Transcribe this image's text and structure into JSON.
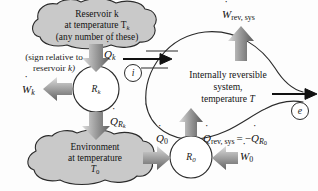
{
  "figure": {
    "type": "thermodynamics-availability-diagram"
  },
  "reservoir": {
    "line1": "Reservoir k",
    "line2_pre": "at temperature T",
    "line2_sub": "k",
    "line3": "(any number of these)",
    "fill": "#c9c9c9",
    "stroke": "#2b2b2b"
  },
  "environment": {
    "line1": "Environment",
    "line2": "at temperature",
    "line3_pre": "T",
    "line3_sub": "0",
    "fill": "#c9c9c9",
    "stroke": "#2b2b2b"
  },
  "system": {
    "line1": "Internally reversible",
    "line2": "system,",
    "line3_pre": "temperature ",
    "line3_var": "T",
    "stroke": "#2b2b2b"
  },
  "note": {
    "line1": "(sign relative to",
    "line2_pre": "reservoir ",
    "line2_var": "k)"
  },
  "cycles": {
    "Rk": {
      "base": "R",
      "sub": "k"
    },
    "R0": {
      "base": "R",
      "sub": "0"
    }
  },
  "ports": {
    "inlet": "i",
    "outlet": "e"
  },
  "labels": {
    "Qk": {
      "base": "Q",
      "sub": "k",
      "dot": true
    },
    "Wk": {
      "base": "W",
      "sub": "k",
      "dot": true
    },
    "QRk": {
      "base": "Q",
      "sub": "R",
      "sub2": "k",
      "dot": true
    },
    "Q0": {
      "base": "Q",
      "sub": "0",
      "dot": true
    },
    "W0": {
      "base": "W",
      "sub": "0",
      "dot": true
    },
    "Wrevsys": {
      "base": "W",
      "sub": "rev, sys",
      "dot": true
    },
    "Qrevsys": {
      "base": "Q",
      "sub": "rev, sys",
      "dot": true
    },
    "equals": "=",
    "minus": "−",
    "QR0": {
      "base": "Q",
      "sub": "R",
      "sub2": "0",
      "dot": true
    }
  },
  "colors": {
    "arrow_gray_light": "#d6d6d6",
    "arrow_gray_dark": "#6f6f6f",
    "arrow_black": "#111111",
    "line": "#2b2b2b",
    "cloud_fill": "#c9c9c9"
  }
}
